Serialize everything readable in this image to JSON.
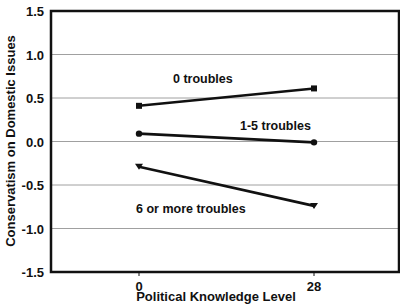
{
  "chart_data": {
    "type": "line",
    "title": "",
    "xlabel": "Political Knowledge Level",
    "ylabel": "Conservatism on Domestic Issues",
    "x": [
      0,
      28
    ],
    "x_tick_labels": [
      "0",
      "28"
    ],
    "ylim": [
      -1.5,
      1.5
    ],
    "y_ticks": [
      1.5,
      1.0,
      0.5,
      0.0,
      -0.5,
      -1.0,
      -1.5
    ],
    "y_tick_labels": [
      "1.5",
      "1.0",
      "0.5",
      "0.0",
      "-0.5",
      "-1.0",
      "-1.5"
    ],
    "grid": "horizontal",
    "legend": "inline labels",
    "series": [
      {
        "name": "0 troubles",
        "marker": "square",
        "values": [
          0.41,
          0.61
        ]
      },
      {
        "name": "1-5 troubles",
        "marker": "circle",
        "values": [
          0.09,
          -0.01
        ]
      },
      {
        "name": "6 or more troubles",
        "marker": "triangle",
        "values": [
          -0.29,
          -0.74
        ]
      }
    ],
    "colors": {
      "line": "#111111",
      "grid": "#888888",
      "frame": "#111111"
    }
  }
}
